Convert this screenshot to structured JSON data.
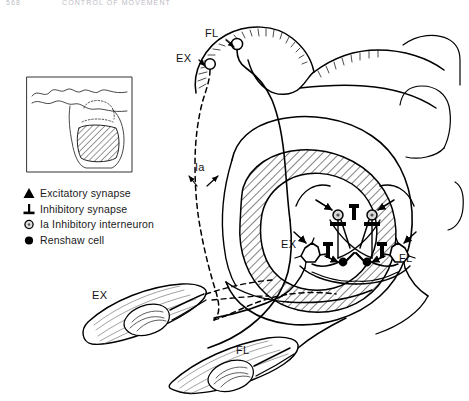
{
  "page": {
    "running_head": {
      "page_number": "568",
      "title": "CONTROL OF MOVEMENT"
    },
    "background_color": "#ffffff",
    "ink_color": "#000000",
    "hatch_color": "#1a1a1a"
  },
  "legend": {
    "items": [
      {
        "glyph": "filled-triangle",
        "label": "Excitatory synapse"
      },
      {
        "glyph": "inhibitory-bar",
        "label": "Inhibitory synapse"
      },
      {
        "glyph": "open-circle",
        "label": "Ia Inhibitory interneuron"
      },
      {
        "glyph": "filled-circle",
        "label": "Renshaw cell"
      }
    ]
  },
  "inset": {
    "name": "spinal-cord-orientation-inset",
    "description": "brain/spinal-cord cross-section with hatched region"
  },
  "labels": {
    "cortex_fl": "FL",
    "cortex_ex": "EX",
    "afferent_ia": "Ia",
    "motoneuron_ex": "EX",
    "motoneuron_fl": "FL",
    "muscle_ex": "EX",
    "muscle_fl": "FL"
  }
}
